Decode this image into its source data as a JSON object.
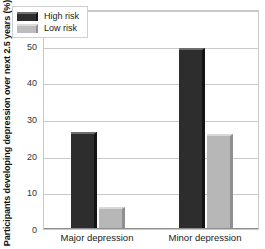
{
  "chart_data": {
    "type": "bar",
    "title": "",
    "subtitle": "",
    "xlabel": "",
    "ylabel": "Participants developing depression over next 2.5 years (%)",
    "categories": [
      "Major depression",
      "Minor depression"
    ],
    "series": [
      {
        "name": "High risk",
        "values": [
          26.5,
          49.5
        ],
        "color": "#2d2d2d"
      },
      {
        "name": "Low risk",
        "values": [
          6,
          26
        ],
        "color": "#b7b7b7"
      }
    ],
    "ylim": [
      0,
      60
    ],
    "yticks": [
      0,
      10,
      20,
      30,
      40,
      50,
      60
    ],
    "ytick_labels": [
      "0",
      "10",
      "20",
      "30",
      "40",
      "50",
      "60"
    ],
    "grid": true,
    "grid_axis": "y",
    "legend_position": "top-left",
    "legend_entries": [
      "High risk",
      "Low risk"
    ],
    "annotations": []
  },
  "legend": {
    "items": [
      {
        "label": "High risk",
        "swatch": "dark-swatch"
      },
      {
        "label": "Low risk",
        "swatch": "light-swatch"
      }
    ]
  }
}
